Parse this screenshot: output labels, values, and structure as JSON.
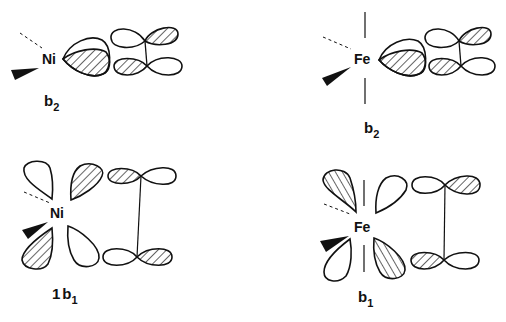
{
  "diagram": {
    "type": "molecular-orbital-sketch",
    "panels": [
      {
        "id": "ni-b2",
        "metal": "Ni",
        "symmetry_label": {
          "main": "b",
          "sub": "2",
          "prefix": ""
        },
        "position": "top-left",
        "description": "Ni d orbital lobe (hatched) interacting in-plane with ethylene pi* orbitals"
      },
      {
        "id": "fe-b2",
        "metal": "Fe",
        "symmetry_label": {
          "main": "b",
          "sub": "2",
          "prefix": ""
        },
        "position": "top-right",
        "description": "Fe d orbital lobe (hatched) with axial ligand lines, interacting with ethylene pi* orbitals"
      },
      {
        "id": "ni-1b1",
        "metal": "Ni",
        "symmetry_label": {
          "main": "b",
          "sub": "1",
          "prefix": "1"
        },
        "position": "bottom-left",
        "description": "Ni d-orbital four-lobe pattern interacting with two separated p-orbital pairs connected by a vertical bond"
      },
      {
        "id": "fe-b1",
        "metal": "Fe",
        "symmetry_label": {
          "main": "b",
          "sub": "1",
          "prefix": ""
        },
        "position": "bottom-right",
        "description": "Fe d-orbital four-lobe pattern with axial ligand lines, interacting with two p-orbital pairs connected by a vertical bond"
      }
    ],
    "colors": {
      "ink": "#111111",
      "background": "#ffffff"
    }
  },
  "labels": {
    "ni_top": "Ni",
    "fe_top": "Fe",
    "ni_bottom": "Ni",
    "fe_bottom": "Fe",
    "b2_left_main": "b",
    "b2_left_sub": "2",
    "b2_right_main": "b",
    "b2_right_sub": "2",
    "b1_left_prefix": "1",
    "b1_left_main": "b",
    "b1_left_sub": "1",
    "b1_right_main": "b",
    "b1_right_sub": "1"
  }
}
